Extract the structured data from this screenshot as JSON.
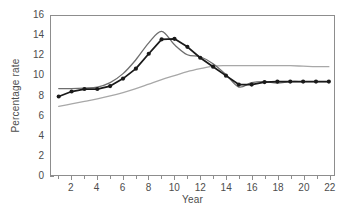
{
  "chart_data": {
    "type": "line",
    "title": "",
    "xlabel": "Year",
    "ylabel": "Percentage rate",
    "xlim": [
      0.4,
      22.4
    ],
    "ylim": [
      0,
      16
    ],
    "xticks": [
      2,
      4,
      6,
      8,
      10,
      12,
      14,
      16,
      18,
      20,
      22
    ],
    "xticks_minor": [
      1,
      3,
      5,
      7,
      9,
      11,
      13,
      15,
      17,
      19,
      21
    ],
    "yticks": [
      0,
      2,
      4,
      6,
      8,
      10,
      12,
      14,
      16
    ],
    "grid": false,
    "legend": "none",
    "x": [
      1,
      2,
      3,
      4,
      5,
      6,
      7,
      8,
      9,
      10,
      11,
      12,
      13,
      14,
      15,
      16,
      17,
      18,
      19,
      20,
      21,
      22
    ],
    "series": [
      {
        "name": "black-markers",
        "color": "#1a1a1a",
        "markers": true,
        "values": [
          7.9,
          8.4,
          8.65,
          8.65,
          8.95,
          9.7,
          10.7,
          12.2,
          13.65,
          13.7,
          12.9,
          11.8,
          10.9,
          10.0,
          9.1,
          9.1,
          9.35,
          9.4,
          9.4,
          9.4,
          9.4,
          9.4
        ]
      },
      {
        "name": "dark-gray",
        "color": "#6e6e6e",
        "markers": false,
        "values": [
          8.7,
          8.7,
          8.75,
          8.85,
          9.3,
          10.2,
          11.6,
          13.3,
          14.45,
          13.1,
          12.1,
          11.9,
          11.2,
          10.1,
          8.85,
          9.3,
          9.4,
          9.25,
          9.4,
          9.4,
          9.4,
          9.4
        ]
      },
      {
        "name": "light-gray",
        "color": "#a8a8a8",
        "markers": false,
        "values": [
          6.9,
          7.15,
          7.4,
          7.65,
          7.95,
          8.3,
          8.7,
          9.15,
          9.6,
          10.0,
          10.4,
          10.7,
          10.95,
          11.0,
          11.0,
          11.0,
          11.0,
          11.0,
          11.0,
          10.95,
          10.9,
          10.9
        ]
      }
    ],
    "ytick_labels": [
      "0",
      "2",
      "4",
      "6",
      "8",
      "10",
      "12",
      "14",
      "16"
    ],
    "xtick_labels": [
      "2",
      "4",
      "6",
      "8",
      "10",
      "12",
      "14",
      "16",
      "18",
      "20",
      "22"
    ]
  },
  "axes": {
    "x_title": "Year",
    "y_title": "Percentage rate"
  },
  "colors": {
    "frame": "#8d8d8d",
    "text": "#4d4d4d",
    "series_black": "#1a1a1a",
    "series_dark_gray": "#6e6e6e",
    "series_light_gray": "#a8a8a8",
    "background": "#ffffff"
  }
}
